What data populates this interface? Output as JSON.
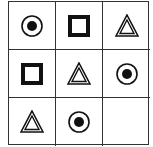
{
  "puzzle": {
    "rows": 3,
    "cols": 3,
    "cells": [
      {
        "row": 0,
        "col": 0,
        "shape": "circle-dot"
      },
      {
        "row": 0,
        "col": 1,
        "shape": "square"
      },
      {
        "row": 0,
        "col": 2,
        "shape": "triangle"
      },
      {
        "row": 1,
        "col": 0,
        "shape": "square"
      },
      {
        "row": 1,
        "col": 1,
        "shape": "triangle"
      },
      {
        "row": 1,
        "col": 2,
        "shape": "circle-dot"
      },
      {
        "row": 2,
        "col": 0,
        "shape": "triangle"
      },
      {
        "row": 2,
        "col": 1,
        "shape": "circle-dot"
      },
      {
        "row": 2,
        "col": 2,
        "shape": "empty"
      }
    ],
    "colors": {
      "line": "#333333",
      "shape": "#111111",
      "background": "#ffffff"
    }
  }
}
